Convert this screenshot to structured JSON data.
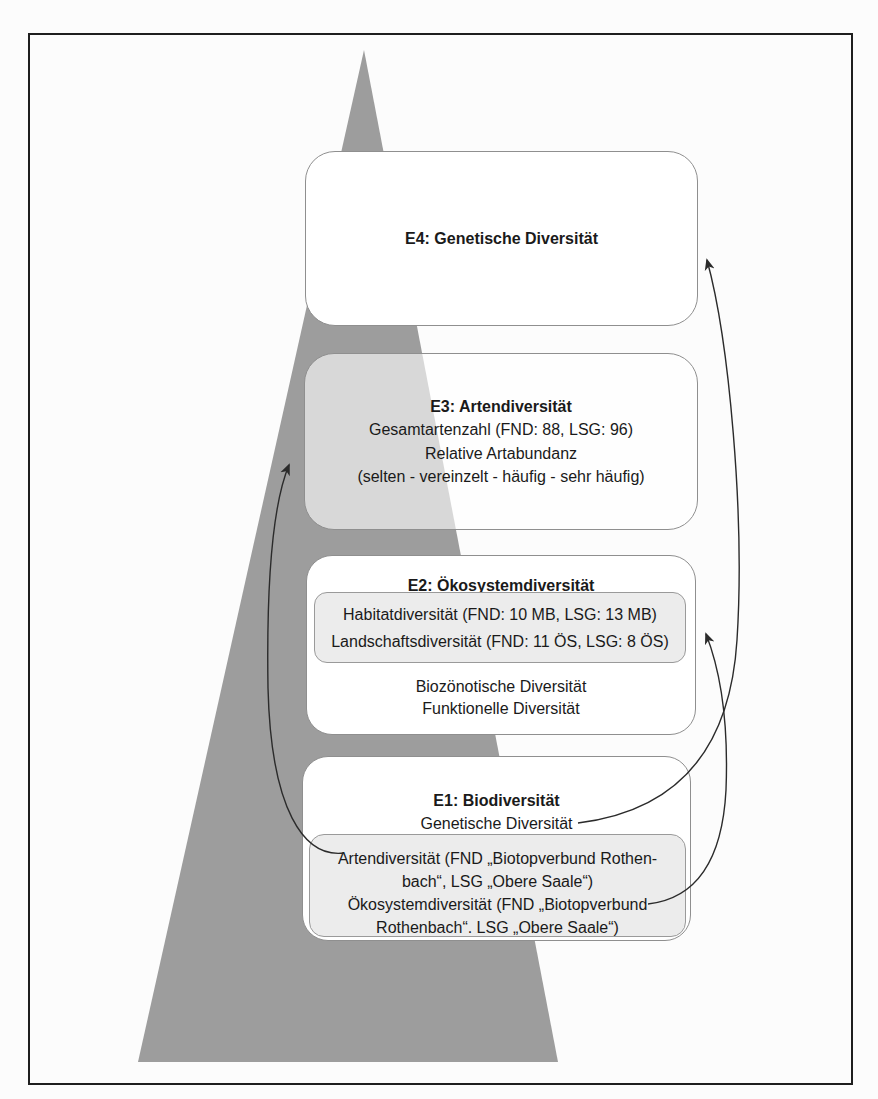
{
  "figure": {
    "type": "pyramid-diagram",
    "colors": {
      "pyramid_fill": "#9d9d9d",
      "box_border": "#8f8f8f",
      "box_fill": "#ffffff",
      "e3_box_fill_translucent": "rgba(255,255,255,0.6)",
      "inner_box_fill": "#ececec",
      "frame_border": "#1f1f1f",
      "arrow": "#2b2b2b",
      "text": "#1a1a1a"
    },
    "levels": {
      "e4": {
        "title": "E4: Genetische Diversität"
      },
      "e3": {
        "title": "E3: Artendiversität",
        "line1": "Gesamtartenzahl (FND: 88, LSG: 96)",
        "line2": "Relative Artabundanz",
        "line3": "(selten - vereinzelt - häufig - sehr häufig)"
      },
      "e2": {
        "title": "E2: Ökosystemdiversität",
        "inner_line1": "Habitatdiversität (FND: 10 MB, LSG: 13 MB)",
        "inner_line2": "Landschaftsdiversität (FND: 11 ÖS, LSG: 8 ÖS)",
        "line1": "Biozönotische Diversität",
        "line2": "Funktionelle Diversität"
      },
      "e1": {
        "title": "E1: Biodiversität",
        "line1": "Genetische Diversität",
        "inner_line1a": "Artendiversität (FND „Biotopverbund Rothen-",
        "inner_line1b": "bach“, LSG „Obere Saale“)",
        "inner_line2a": "Ökosystemdiversität (FND „Biotopverbund",
        "inner_line2b": "Rothenbach“. LSG „Obere Saale“)"
      }
    },
    "connections": [
      {
        "from": "E1: Genetische Diversität",
        "to": "E4"
      },
      {
        "from": "E1: Artendiversität",
        "to": "E3"
      },
      {
        "from": "E1: Ökosystemdiversität",
        "to": "E2"
      }
    ]
  }
}
